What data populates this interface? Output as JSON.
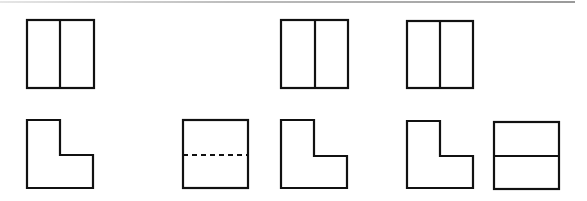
{
  "diagram": {
    "type": "orthographic-view-puzzle",
    "colors": {
      "stroke": "#111111",
      "background": "#ffffff",
      "top_rule": "#9a9a9a"
    },
    "rows": [
      {
        "name": "top-row",
        "figures": [
          {
            "id": "top-1",
            "kind": "square-vertical-split",
            "x": 27,
            "y": 20,
            "w": 67,
            "h": 68,
            "divider": 60
          },
          {
            "id": "top-2",
            "kind": "square-vertical-split",
            "x": 281,
            "y": 20,
            "w": 67,
            "h": 68,
            "divider": 315
          },
          {
            "id": "top-3",
            "kind": "square-vertical-split",
            "x": 407,
            "y": 21,
            "w": 66,
            "h": 67,
            "divider": 440
          }
        ]
      },
      {
        "name": "bottom-row",
        "figures": [
          {
            "id": "bottom-1",
            "kind": "l-shape",
            "x": 27,
            "y": 120,
            "right": 93,
            "bottom": 188,
            "notch_x": 60,
            "notch_y": 155
          },
          {
            "id": "bottom-2",
            "kind": "square-dashed-horizontal",
            "x": 183,
            "y": 120,
            "w": 65,
            "h": 68,
            "divider": 155
          },
          {
            "id": "bottom-3",
            "kind": "l-shape",
            "x": 281,
            "y": 120,
            "right": 347,
            "bottom": 188,
            "notch_x": 314,
            "notch_y": 156
          },
          {
            "id": "bottom-4",
            "kind": "l-shape",
            "x": 407,
            "y": 121,
            "right": 473,
            "bottom": 188,
            "notch_x": 440,
            "notch_y": 156
          },
          {
            "id": "bottom-5",
            "kind": "square-horizontal-split",
            "x": 494,
            "y": 122,
            "w": 65,
            "h": 67,
            "divider": 156
          }
        ]
      }
    ]
  }
}
